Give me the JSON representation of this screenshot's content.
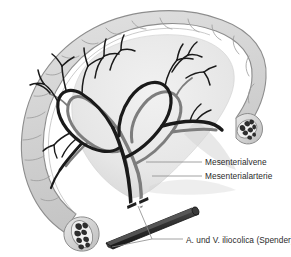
{
  "figure": {
    "background_color": "#ffffff"
  },
  "colors": {
    "bowel_fill": "#d6d6d6",
    "bowel_outline": "#8d8d8d",
    "mesentery_fill": "#ebebeb",
    "mesentery_shadow": "#d0d0d0",
    "vein": "#1a1a1a",
    "artery": "#7d7d7d",
    "graft": "#2a2a2a",
    "graft_highlight": "#565656",
    "lumen": "#2e2e2e",
    "leader_line": "#8a8a8a",
    "label_text": "#2b2b2b"
  },
  "anatomy": {
    "bowel_label": "colon-arc",
    "mesentery_label": "mesentery-fan",
    "stump_proximal_label": "bowel-stump-lower-left",
    "stump_distal_label": "bowel-stump-upper-right",
    "vein_label": "mesenteric-vein",
    "artery_label": "mesenteric-artery",
    "graft_label": "iliocolic-donor-vessel"
  },
  "labels": [
    {
      "id": "mesenterialvene",
      "text": "Mesenterialvene",
      "icon": "leader-line-icon",
      "x": 205,
      "y": 162
    },
    {
      "id": "mesenterialarterie",
      "text": "Mesenterialarterie",
      "icon": "leader-line-icon",
      "x": 205,
      "y": 176
    },
    {
      "id": "iliocolica",
      "text": "A. und V. iliocolica (Spender)",
      "icon": "leader-line-icon",
      "x": 186,
      "y": 243
    }
  ]
}
